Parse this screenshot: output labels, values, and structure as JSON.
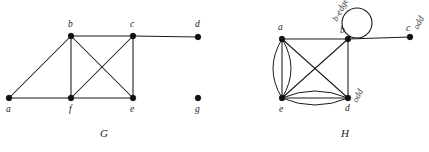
{
  "figure": {
    "caption_left": "G",
    "caption_right": "H",
    "caption_left_pos": {
      "x": 100,
      "y": 137
    },
    "caption_right_pos": {
      "x": 341,
      "y": 137
    },
    "background_color": "#ffffff",
    "ink_color": "#1a1a1a",
    "vertex_color": "#111111"
  },
  "graphs": [
    {
      "name": "G",
      "type": "simple-graph",
      "vertices": [
        {
          "id": "a",
          "label": "a",
          "x": 9,
          "y": 98,
          "label_x": 6,
          "label_y": 112
        },
        {
          "id": "b",
          "label": "b",
          "x": 71,
          "y": 36,
          "label_x": 68,
          "label_y": 27
        },
        {
          "id": "c",
          "label": "c",
          "x": 133,
          "y": 36,
          "label_x": 130,
          "label_y": 27
        },
        {
          "id": "d",
          "label": "d",
          "x": 198,
          "y": 37,
          "label_x": 195,
          "label_y": 27
        },
        {
          "id": "e",
          "label": "e",
          "x": 133,
          "y": 98,
          "label_x": 130,
          "label_y": 112
        },
        {
          "id": "f",
          "label": "f",
          "x": 71,
          "y": 98,
          "label_x": 69,
          "label_y": 112
        },
        {
          "id": "g",
          "label": "g",
          "x": 198,
          "y": 98,
          "label_x": 195,
          "label_y": 112
        }
      ],
      "edges": [
        {
          "from": "a",
          "to": "b",
          "kind": "line"
        },
        {
          "from": "a",
          "to": "f",
          "kind": "line"
        },
        {
          "from": "b",
          "to": "c",
          "kind": "line"
        },
        {
          "from": "b",
          "to": "f",
          "kind": "line"
        },
        {
          "from": "b",
          "to": "e",
          "kind": "line"
        },
        {
          "from": "c",
          "to": "d",
          "kind": "line"
        },
        {
          "from": "c",
          "to": "f",
          "kind": "line"
        },
        {
          "from": "c",
          "to": "e",
          "kind": "line"
        },
        {
          "from": "f",
          "to": "e",
          "kind": "line"
        }
      ],
      "isolated_vertices": [
        "g"
      ]
    },
    {
      "name": "H",
      "type": "multigraph",
      "vertices": [
        {
          "id": "a",
          "label": "a",
          "x": 282,
          "y": 39,
          "label_x": 278,
          "label_y": 30
        },
        {
          "id": "b",
          "label": "b",
          "x": 348,
          "y": 39,
          "label_x": 340,
          "label_y": 33
        },
        {
          "id": "c",
          "label": "c",
          "x": 410,
          "y": 37,
          "label_x": 406,
          "label_y": 31
        },
        {
          "id": "d",
          "label": "d",
          "x": 348,
          "y": 98,
          "label_x": 345,
          "label_y": 111
        },
        {
          "id": "e",
          "label": "e",
          "x": 282,
          "y": 98,
          "label_x": 279,
          "label_y": 112
        }
      ],
      "edges": [
        {
          "from": "a",
          "to": "b",
          "kind": "line"
        },
        {
          "from": "b",
          "to": "c",
          "kind": "line"
        },
        {
          "from": "b",
          "to": "d",
          "kind": "line"
        },
        {
          "from": "a",
          "to": "d",
          "kind": "line"
        },
        {
          "from": "e",
          "to": "b",
          "kind": "line"
        },
        {
          "from": "a",
          "to": "e",
          "kind": "line",
          "multiplicity_note": "straight"
        },
        {
          "from": "a",
          "to": "e",
          "kind": "curve",
          "bow": -9
        },
        {
          "from": "a",
          "to": "e",
          "kind": "curve",
          "bow": 9
        },
        {
          "from": "e",
          "to": "d",
          "kind": "line",
          "multiplicity_note": "straight"
        },
        {
          "from": "e",
          "to": "d",
          "kind": "curve",
          "bow": -7
        },
        {
          "from": "e",
          "to": "d",
          "kind": "curve",
          "bow": 7
        }
      ],
      "loops": [
        {
          "at": "b",
          "cx": 357,
          "cy": 23,
          "r": 15
        }
      ]
    }
  ],
  "annotations": [
    {
      "id": "scribble-b",
      "text": "b-edge",
      "x": 337,
      "y": 22,
      "rotation": -62
    },
    {
      "id": "scribble-d",
      "text": "odd",
      "x": 357,
      "y": 103,
      "rotation": -62
    },
    {
      "id": "scribble-c",
      "text": "odd",
      "x": 418,
      "y": 30,
      "rotation": -62
    }
  ]
}
